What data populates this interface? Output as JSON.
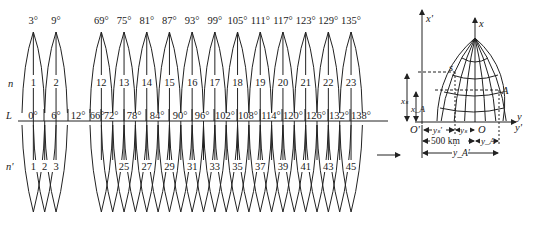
{
  "figure": {
    "left_panel": {
      "row_labels": {
        "n": "n",
        "L": "L",
        "n_prime": "n'"
      },
      "six_degree_zones": [
        {
          "zone": "1",
          "central_meridian": "3°"
        },
        {
          "zone": "2",
          "central_meridian": "9°"
        },
        {
          "zone": "12",
          "central_meridian": "69°"
        },
        {
          "zone": "13",
          "central_meridian": "75°"
        },
        {
          "zone": "14",
          "central_meridian": "81°"
        },
        {
          "zone": "15",
          "central_meridian": "87°"
        },
        {
          "zone": "16",
          "central_meridian": "93°"
        },
        {
          "zone": "17",
          "central_meridian": "99°"
        },
        {
          "zone": "18",
          "central_meridian": "105°"
        },
        {
          "zone": "19",
          "central_meridian": "111°"
        },
        {
          "zone": "20",
          "central_meridian": "117°"
        },
        {
          "zone": "21",
          "central_meridian": "123°"
        },
        {
          "zone": "22",
          "central_meridian": "129°"
        },
        {
          "zone": "23",
          "central_meridian": "135°"
        }
      ],
      "L_line_labels": [
        "0°",
        "6°",
        "12°",
        "66°",
        "72°",
        "78°",
        "84°",
        "90°",
        "96°",
        "102°",
        "108°",
        "114°",
        "120°",
        "126°",
        "132°",
        "138°"
      ],
      "three_degree_zone_labels": [
        "1",
        "2",
        "3",
        "25",
        "27",
        "29",
        "31",
        "33",
        "35",
        "37",
        "39",
        "41",
        "43",
        "45"
      ]
    },
    "arrow": "right-arrow",
    "right_panel": {
      "axis_x_prime": "x'",
      "axis_x": "x",
      "axis_y": "y",
      "axis_y_prime": "y'",
      "origin_prime": "O'",
      "origin": "O",
      "point_s": "s",
      "point_A": "A",
      "x_s": "xₛ",
      "x_A": "x_A",
      "y_s_prime": "yₛ'",
      "y_s": "yₛ",
      "y_A": "y_A",
      "y_A_prime": "y_A'",
      "false_easting": "500 km"
    }
  }
}
